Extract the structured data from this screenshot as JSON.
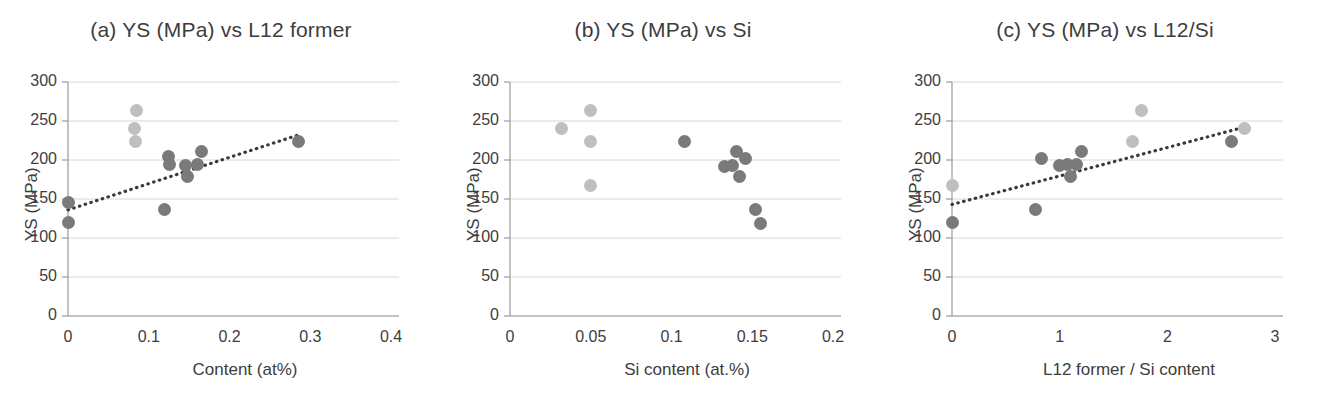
{
  "figure": {
    "background": "#ffffff",
    "panel_count": 3,
    "marker_colors": {
      "dark": "#7a7a7a",
      "light": "#bfbfbf"
    },
    "trendline_color": "#3a3a3a",
    "grid_color": "#d8d8d8",
    "axis_color": "#9a9a9a"
  },
  "chart_data": [
    {
      "type": "scatter",
      "panel": "a",
      "title": "(a) YS (MPa) vs L12 former",
      "xlabel": "Content (at%)",
      "ylabel": "YS (MPa)",
      "xlim": [
        0,
        0.4
      ],
      "ylim": [
        0,
        300
      ],
      "xticks": [
        "0",
        "0.1",
        "0.2",
        "0.3",
        "0.4"
      ],
      "xtick_values": [
        0,
        0.1,
        0.2,
        0.3,
        0.4
      ],
      "yticks": [
        "0",
        "50",
        "100",
        "150",
        "200",
        "250",
        "300"
      ],
      "ytick_values": [
        0,
        50,
        100,
        150,
        200,
        250,
        300
      ],
      "grid": "horizontal",
      "legend": "none",
      "series": [
        {
          "name": "dark-markers",
          "color": "#7a7a7a",
          "points": [
            {
              "x": 0.0,
              "y": 145
            },
            {
              "x": 0.0,
              "y": 120
            },
            {
              "x": 0.12,
              "y": 137
            },
            {
              "x": 0.125,
              "y": 204
            },
            {
              "x": 0.126,
              "y": 194
            },
            {
              "x": 0.145,
              "y": 193
            },
            {
              "x": 0.148,
              "y": 179
            },
            {
              "x": 0.16,
              "y": 194
            },
            {
              "x": 0.165,
              "y": 211
            },
            {
              "x": 0.285,
              "y": 224
            }
          ]
        },
        {
          "name": "light-markers",
          "color": "#bfbfbf",
          "points": [
            {
              "x": 0.085,
              "y": 263
            },
            {
              "x": 0.082,
              "y": 241
            },
            {
              "x": 0.084,
              "y": 224
            }
          ]
        }
      ],
      "trendline": {
        "style": "dotted",
        "x0": 0.0,
        "y0": 136,
        "x1": 0.288,
        "y1": 233
      }
    },
    {
      "type": "scatter",
      "panel": "b",
      "title": "(b) YS (MPa) vs Si",
      "xlabel": "Si content (at.%)",
      "ylabel": "YS (MPa)",
      "xlim": [
        0,
        0.2
      ],
      "ylim": [
        0,
        300
      ],
      "xticks": [
        "0",
        "0.05",
        "0.1",
        "0.15",
        "0.2"
      ],
      "xtick_values": [
        0,
        0.05,
        0.1,
        0.15,
        0.2
      ],
      "yticks": [
        "0",
        "50",
        "100",
        "150",
        "200",
        "250",
        "300"
      ],
      "ytick_values": [
        0,
        50,
        100,
        150,
        200,
        250,
        300
      ],
      "grid": "horizontal",
      "legend": "none",
      "series": [
        {
          "name": "dark-markers",
          "color": "#7a7a7a",
          "points": [
            {
              "x": 0.108,
              "y": 224
            },
            {
              "x": 0.133,
              "y": 192
            },
            {
              "x": 0.138,
              "y": 193
            },
            {
              "x": 0.14,
              "y": 211
            },
            {
              "x": 0.142,
              "y": 179
            },
            {
              "x": 0.146,
              "y": 202
            },
            {
              "x": 0.152,
              "y": 137
            },
            {
              "x": 0.155,
              "y": 119
            }
          ]
        },
        {
          "name": "light-markers",
          "color": "#bfbfbf",
          "points": [
            {
              "x": 0.032,
              "y": 241
            },
            {
              "x": 0.05,
              "y": 263
            },
            {
              "x": 0.05,
              "y": 224
            },
            {
              "x": 0.05,
              "y": 167
            }
          ]
        }
      ],
      "trendline": null
    },
    {
      "type": "scatter",
      "panel": "c",
      "title": "(c) YS (MPa) vs L12/Si",
      "xlabel": "L12 former / Si content",
      "ylabel": "YS (MPa)",
      "xlim": [
        0,
        3
      ],
      "ylim": [
        0,
        300
      ],
      "xticks": [
        "0",
        "1",
        "2",
        "3"
      ],
      "xtick_values": [
        0,
        1,
        2,
        3
      ],
      "yticks": [
        "0",
        "50",
        "100",
        "150",
        "200",
        "250",
        "300"
      ],
      "ytick_values": [
        0,
        50,
        100,
        150,
        200,
        250,
        300
      ],
      "grid": "horizontal",
      "legend": "none",
      "series": [
        {
          "name": "dark-markers",
          "color": "#7a7a7a",
          "points": [
            {
              "x": 0.0,
              "y": 120
            },
            {
              "x": 0.78,
              "y": 137
            },
            {
              "x": 0.83,
              "y": 202
            },
            {
              "x": 1.0,
              "y": 193
            },
            {
              "x": 1.07,
              "y": 194
            },
            {
              "x": 1.1,
              "y": 179
            },
            {
              "x": 1.16,
              "y": 194
            },
            {
              "x": 1.2,
              "y": 211
            },
            {
              "x": 2.6,
              "y": 224
            }
          ]
        },
        {
          "name": "light-markers",
          "color": "#bfbfbf",
          "points": [
            {
              "x": 0.0,
              "y": 167
            },
            {
              "x": 1.68,
              "y": 224
            },
            {
              "x": 1.76,
              "y": 263
            },
            {
              "x": 2.72,
              "y": 241
            }
          ]
        }
      ],
      "trendline": {
        "style": "dotted",
        "x0": 0.0,
        "y0": 143,
        "x1": 2.74,
        "y1": 243
      }
    }
  ]
}
